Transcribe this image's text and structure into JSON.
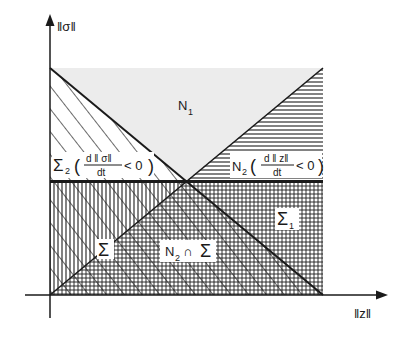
{
  "axes": {
    "y_label": "‖σ‖",
    "x_label": "‖z‖"
  },
  "regions": {
    "n1": {
      "name": "N",
      "sub": "1"
    },
    "sigma2": {
      "name": "Σ",
      "sub": "2",
      "num": "d ‖ σ‖",
      "den": "dt",
      "cond": "< 0"
    },
    "n2": {
      "name": "N",
      "sub": "2",
      "num": "d ‖ z‖",
      "den": "dt",
      "cond": "< 0"
    },
    "sigma": {
      "name": "Σ"
    },
    "n2_cap_sigma": {
      "name": "N",
      "sub": "2",
      "op": "∩",
      "rhs": "Σ"
    },
    "sigma1": {
      "name": "Σ",
      "sub": "1"
    }
  },
  "colors": {
    "ink": "#1a1a1a",
    "stipple": "#ececec",
    "background": "#ffffff"
  }
}
